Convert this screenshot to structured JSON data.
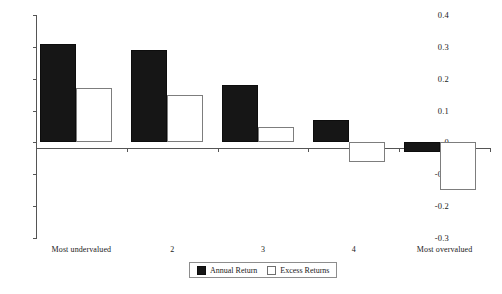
{
  "chart_data": {
    "type": "bar",
    "title": "",
    "subtitle": "",
    "xlabel": "",
    "ylabel": "",
    "categories": [
      "Most undervalued",
      "2",
      "3",
      "4",
      "Most overvalued"
    ],
    "series": [
      {
        "name": "Annual Return",
        "values": [
          0.31,
          0.29,
          0.18,
          0.07,
          -0.03
        ],
        "color": "#161616",
        "style": "filled"
      },
      {
        "name": "Excess Returns",
        "values": [
          0.17,
          0.15,
          0.05,
          -0.06,
          -0.15
        ],
        "color": "#ffffff",
        "style": "hollow"
      }
    ],
    "ylim": [
      -0.3,
      0.4
    ],
    "ytick_values": [
      0.4,
      0.3,
      0.2,
      0.1,
      0,
      -0.1,
      -0.2,
      -0.3
    ],
    "ytick_labels": [
      "0.4",
      "0.3",
      "0.2",
      "0.1",
      "0",
      "-0.1",
      "-0.2",
      "-0.3"
    ],
    "grid": false,
    "legend_position": "bottom-center"
  },
  "legend": {
    "entries": [
      {
        "label": "Annual Return"
      },
      {
        "label": "Excess Returns"
      }
    ]
  }
}
